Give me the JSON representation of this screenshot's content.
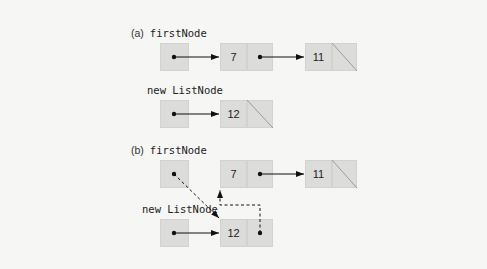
{
  "diagram": {
    "part_a": {
      "tag": "(a)",
      "first_node_label": "firstNode",
      "new_node_label": "new ListNode",
      "list_values": [
        "7",
        "11"
      ],
      "new_node_value": "12"
    },
    "part_b": {
      "tag": "(b)",
      "first_node_label": "firstNode",
      "new_node_label": "new ListNode",
      "list_values": [
        "7",
        "11"
      ],
      "new_node_value": "12"
    },
    "colors": {
      "background": "#f6f6f5",
      "cell_fill": "#dcdcdb",
      "line": "#111111"
    }
  }
}
